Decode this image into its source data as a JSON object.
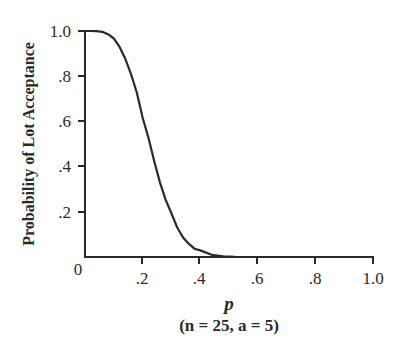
{
  "chart_data": {
    "type": "line",
    "title": "",
    "xlabel": "p",
    "subtitle": "(n = 25, a = 5)",
    "ylabel": "Probability of Lot Acceptance",
    "xlim": [
      0,
      1.0
    ],
    "ylim": [
      0,
      1.0
    ],
    "grid": false,
    "legend": null,
    "x_ticks": [
      ".2",
      ".4",
      ".6",
      ".8",
      "1.0"
    ],
    "y_ticks": [
      "0",
      ".2",
      ".4",
      ".6",
      ".8",
      "1.0"
    ],
    "series": [
      {
        "name": "OC curve",
        "x": [
          0,
          0.02,
          0.04,
          0.06,
          0.08,
          0.1,
          0.12,
          0.14,
          0.16,
          0.18,
          0.2,
          0.22,
          0.24,
          0.26,
          0.28,
          0.3,
          0.32,
          0.34,
          0.36,
          0.38,
          0.4,
          0.44,
          0.48,
          0.52,
          0.6,
          0.8,
          1.0
        ],
        "values": [
          1.0,
          1.0,
          0.9995,
          0.9963,
          0.9858,
          0.9666,
          0.9298,
          0.8769,
          0.8083,
          0.7278,
          0.6167,
          0.5289,
          0.4263,
          0.3305,
          0.2539,
          0.1935,
          0.1306,
          0.0878,
          0.0587,
          0.0367,
          0.0294,
          0.0098,
          0.0029,
          0.0008,
          0.0001,
          0,
          0
        ]
      }
    ]
  },
  "labels": {
    "ylabel": "Probability of Lot Acceptance",
    "xlabel": "p",
    "subtitle": "(n = 25, a = 5)",
    "x0": "0",
    "x2": ".2",
    "x4": ".4",
    "x6": ".6",
    "x8": ".8",
    "x10": "1.0",
    "y2": ".2",
    "y4": ".4",
    "y6": ".6",
    "y8": ".8",
    "y10": "1.0"
  }
}
